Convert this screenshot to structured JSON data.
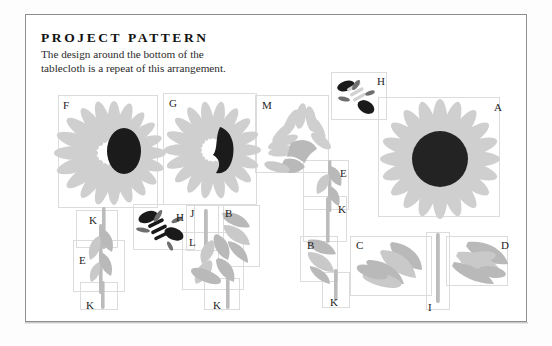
{
  "page": {
    "title": "PROJECT PATTERN",
    "subtitle": "The design around the bottom of the tablecloth is a repeat of this arrangement.",
    "subtitle_line1": "The design around the bottom of the",
    "subtitle_line2": "tablecloth is a repeat of this arrangement.",
    "background_color": "#ffffff",
    "frame_color": "#8e8e8e",
    "box_outline_color": "#dcdcdc",
    "motif_light_color": "#cfcfcf",
    "motif_mid_color": "#b9b9b9",
    "motif_dark_color": "#1b1b1b"
  },
  "pattern_pieces": [
    {
      "label": "F",
      "kind": "sunflower",
      "description": "sunflower with oval dark center",
      "label_x": 63,
      "label_y": 100
    },
    {
      "label": "G",
      "kind": "sunflower",
      "description": "sunflower with kidney-shaped dark center",
      "label_x": 169,
      "label_y": 98
    },
    {
      "label": "M",
      "kind": "leaf-spray",
      "description": "partial flower leaf spray",
      "label_x": 262,
      "label_y": 100
    },
    {
      "label": "H",
      "kind": "bee",
      "description": "bee motif, upper",
      "label_x": 377,
      "label_y": 76
    },
    {
      "label": "A",
      "kind": "sunflower",
      "description": "large sunflower with round dark center",
      "label_x": 494,
      "label_y": 102
    },
    {
      "label": "E",
      "kind": "leaf-pair",
      "description": "leaf pair on stem, right column",
      "label_x": 340,
      "label_y": 168
    },
    {
      "label": "K",
      "kind": "stem",
      "description": "short stem segment, right column",
      "label_x": 338,
      "label_y": 204
    },
    {
      "label": "K",
      "kind": "stem",
      "description": "short stem segment, left column top",
      "label_x": 89,
      "label_y": 215
    },
    {
      "label": "H",
      "kind": "bee",
      "description": "bee motif, lower",
      "label_x": 176,
      "label_y": 212
    },
    {
      "label": "J",
      "kind": "stem",
      "description": "stem segment, center cluster",
      "label_x": 190,
      "label_y": 208
    },
    {
      "label": "B",
      "kind": "leaf",
      "description": "curved leaf, center cluster",
      "label_x": 225,
      "label_y": 208
    },
    {
      "label": "E",
      "kind": "leaf-pair",
      "description": "leaf pair, left column",
      "label_x": 79,
      "label_y": 255
    },
    {
      "label": "L",
      "kind": "leaf-cluster",
      "description": "broad leaf cluster",
      "label_x": 189,
      "label_y": 237
    },
    {
      "label": "B",
      "kind": "leaf",
      "description": "curved leaf, right of center",
      "label_x": 307,
      "label_y": 240
    },
    {
      "label": "C",
      "kind": "leaf-cluster",
      "description": "leaf cluster, lower right",
      "label_x": 356,
      "label_y": 240
    },
    {
      "label": "D",
      "kind": "leaf-cluster",
      "description": "leaf cluster, far lower right",
      "label_x": 501,
      "label_y": 240
    },
    {
      "label": "K",
      "kind": "stem",
      "description": "short stem segment, left column bottom",
      "label_x": 86,
      "label_y": 300
    },
    {
      "label": "K",
      "kind": "stem",
      "description": "short stem segment, center bottom",
      "label_x": 213,
      "label_y": 300
    },
    {
      "label": "K",
      "kind": "stem",
      "description": "short stem segment, lower right",
      "label_x": 330,
      "label_y": 297
    },
    {
      "label": "I",
      "kind": "stem",
      "description": "long vertical stem",
      "label_x": 428,
      "label_y": 302
    }
  ]
}
